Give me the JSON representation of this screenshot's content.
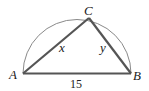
{
  "diagram": {
    "type": "geometry",
    "vertices": {
      "A": {
        "label": "A"
      },
      "B": {
        "label": "B"
      },
      "C": {
        "label": "C"
      }
    },
    "sides": {
      "AC": {
        "label": "x"
      },
      "BC": {
        "label": "y"
      },
      "AB": {
        "label": "15"
      }
    },
    "colors": {
      "triangle": "#555555",
      "arc": "#888888",
      "text": "#222222"
    }
  }
}
